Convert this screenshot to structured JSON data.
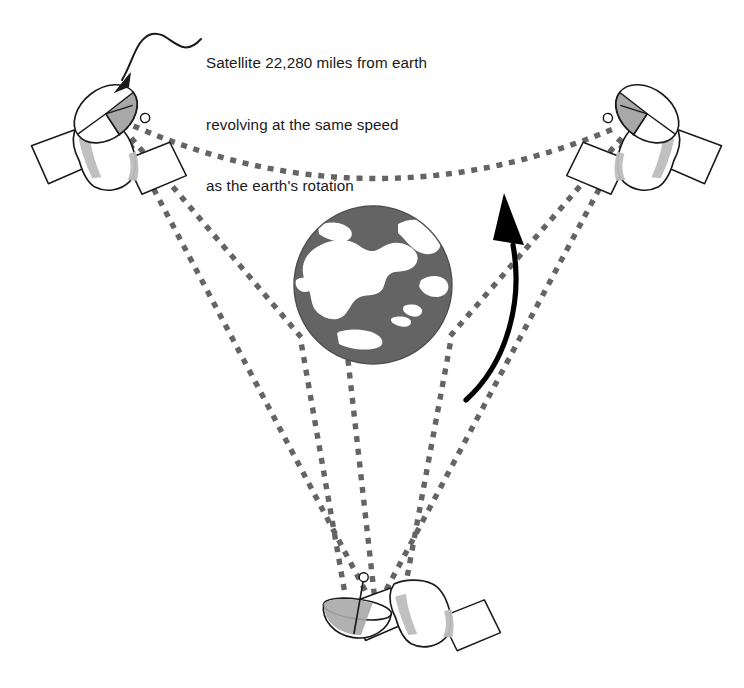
{
  "figure": {
    "background_color": "#ffffff"
  },
  "annotation": {
    "name": "satellite-callout",
    "line1": "Satellite 22,280 miles from earth",
    "line2": "revolving at the same speed",
    "line3": "as the earth's rotation",
    "leader_line": "wavy-arrow-pointing-down-left",
    "arrow_target": "top-left-satellite"
  },
  "colors": {
    "line_gray": "#6b6b6b",
    "dot_gray": "#646464",
    "earth_ocean": "#646464",
    "earth_land": "#ffffff",
    "earth_outline": "#4f4f4f",
    "satellite_outline": "#1a1a1a",
    "satellite_shade": "#bdbdbd",
    "satellite_dish_shade": "#a8a8a8",
    "arrow_black": "#000000",
    "text": "#1a1a1a"
  },
  "earth": {
    "name": "earth-globe",
    "label": "Earth (north polar view)",
    "center_x": 373,
    "center_y": 285,
    "radius": 79,
    "ocean_color": "#646464",
    "land_color": "#ffffff"
  },
  "rotation_arrow": {
    "name": "earth-rotation-arrow",
    "label": "Direction of earth rotation",
    "direction": "counterclockwise-upward",
    "color": "#000000"
  },
  "satellites": [
    {
      "id": "satellite-top-left",
      "label": "Satellite (top left)",
      "x": 95,
      "y": 135,
      "dish_direction": "down-right",
      "panels": 2
    },
    {
      "id": "satellite-top-right",
      "label": "Satellite (top right)",
      "x": 655,
      "y": 135,
      "dish_direction": "down-left",
      "panels": 2
    },
    {
      "id": "satellite-bottom",
      "label": "Satellite (bottom)",
      "x": 385,
      "y": 612,
      "dish_direction": "up",
      "panels": 2
    }
  ],
  "signal_paths": {
    "name": "dotted-signal-paths",
    "style": "square-dotted",
    "color": "#646464",
    "description": "Dotted lines linking each satellite to the others and tangent to the earth",
    "segments": [
      {
        "name": "path-topleft-to-topright",
        "from": "satellite-top-left",
        "to": "satellite-top-right"
      },
      {
        "name": "path-topleft-to-bottom",
        "from": "satellite-top-left",
        "to": "satellite-bottom"
      },
      {
        "name": "path-topright-to-bottom",
        "from": "satellite-top-right",
        "to": "satellite-bottom"
      },
      {
        "name": "path-topleft-tangent-earth",
        "from": "satellite-top-left",
        "to": "earth"
      },
      {
        "name": "path-topright-tangent-earth",
        "from": "satellite-top-right",
        "to": "earth"
      },
      {
        "name": "path-bottom-tangent-earth",
        "from": "satellite-bottom",
        "to": "earth"
      }
    ]
  }
}
